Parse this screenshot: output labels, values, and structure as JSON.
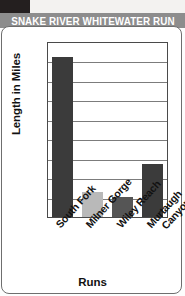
{
  "banner": {
    "title": "SNAKE RIVER WHITEWATER RUN",
    "background_color": "#8d8d8d",
    "text_color": "#ffffff"
  },
  "chart_data": {
    "type": "bar",
    "title": "SNAKE RIVER WHITEWATER RUN",
    "xlabel": "Runs",
    "ylabel": "Length in Miles",
    "categories": [
      "South Fork",
      "Milner Gorge",
      "Wiley Reach",
      "Murtaugh Canyon"
    ],
    "category_lines": [
      [
        "South Fork"
      ],
      [
        "Milner Gorge"
      ],
      [
        "Wiley Reach"
      ],
      [
        "Murtaugh",
        "Canyon"
      ]
    ],
    "values": [
      41,
      6.5,
      5,
      13.5
    ],
    "bar_colors": [
      "#3b3b3b",
      "#b9b9b9",
      "#555555",
      "#3b3b3b"
    ],
    "ylim": [
      0,
      45
    ],
    "ytick_step": 5,
    "yticks": [
      0,
      5,
      10,
      15,
      20,
      25,
      30,
      35,
      40,
      45
    ],
    "ytick_labels": [
      "0",
      "5",
      "10",
      "15",
      "20",
      "25",
      "30",
      "35",
      "40",
      "45"
    ],
    "grid": true,
    "grid_color": "#7c7c7c",
    "legend": "none",
    "axis_color": "#4a4a4a"
  }
}
